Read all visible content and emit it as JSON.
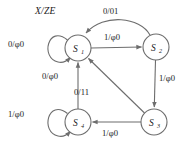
{
  "diagram": {
    "title": "X/ZE",
    "type": "state-transition-diagram",
    "stroke_color": "#6d6d6d",
    "text_color": "#1a1a1a",
    "background": "#ffffff",
    "states": [
      {
        "id": "S1",
        "name": "S",
        "subscript": "1",
        "cx": 78,
        "cy": 48,
        "r": 13
      },
      {
        "id": "S2",
        "name": "S",
        "subscript": "2",
        "cx": 156,
        "cy": 47,
        "r": 13
      },
      {
        "id": "S3",
        "name": "S",
        "subscript": "3",
        "cx": 154,
        "cy": 122,
        "r": 13
      },
      {
        "id": "S4",
        "name": "S",
        "subscript": "4",
        "cx": 78,
        "cy": 122,
        "r": 13
      }
    ],
    "transitions": [
      {
        "id": "t-s1-self",
        "from": "S1",
        "to": "S1",
        "input": "0",
        "output": "φ0",
        "label": "0/φ0",
        "kind": "self-loop-left"
      },
      {
        "id": "t-s1-s2",
        "from": "S1",
        "to": "S2",
        "input": "1",
        "output": "φ0",
        "label": "1/φ0",
        "kind": "straight"
      },
      {
        "id": "t-s2-s1",
        "from": "S2",
        "to": "S1",
        "input": "0",
        "output": "01",
        "label": "0/01",
        "kind": "curved-top"
      },
      {
        "id": "t-s2-s3",
        "from": "S2",
        "to": "S3",
        "input": "1",
        "output": "φ0",
        "label": "1/φ0",
        "kind": "straight"
      },
      {
        "id": "t-s3-s4",
        "from": "S3",
        "to": "S4",
        "input": "1",
        "output": "φ0",
        "label": "1/φ0",
        "kind": "straight"
      },
      {
        "id": "t-s3-s1",
        "from": "S3",
        "to": "S1",
        "input": "0",
        "output": "11",
        "label": "0/11",
        "kind": "diagonal"
      },
      {
        "id": "t-s4-s1",
        "from": "S4",
        "to": "S1",
        "input": "0",
        "output": "φ0",
        "label": "0/φ0",
        "kind": "straight"
      },
      {
        "id": "t-s4-self",
        "from": "S4",
        "to": "S4",
        "input": "1",
        "output": "φ0",
        "label": "1/φ0",
        "kind": "self-loop-left"
      }
    ],
    "labels": {
      "header": "X/ZE",
      "s1_self": "0/φ0",
      "s1_to_s2": "1/φ0",
      "s2_to_s1": "0/01",
      "s2_to_s3": "1/φ0",
      "s3_to_s4": "1/φ0",
      "s3_to_s1": "0/11",
      "s4_to_s1": "0/φ0",
      "s4_self": "1/φ0"
    }
  }
}
